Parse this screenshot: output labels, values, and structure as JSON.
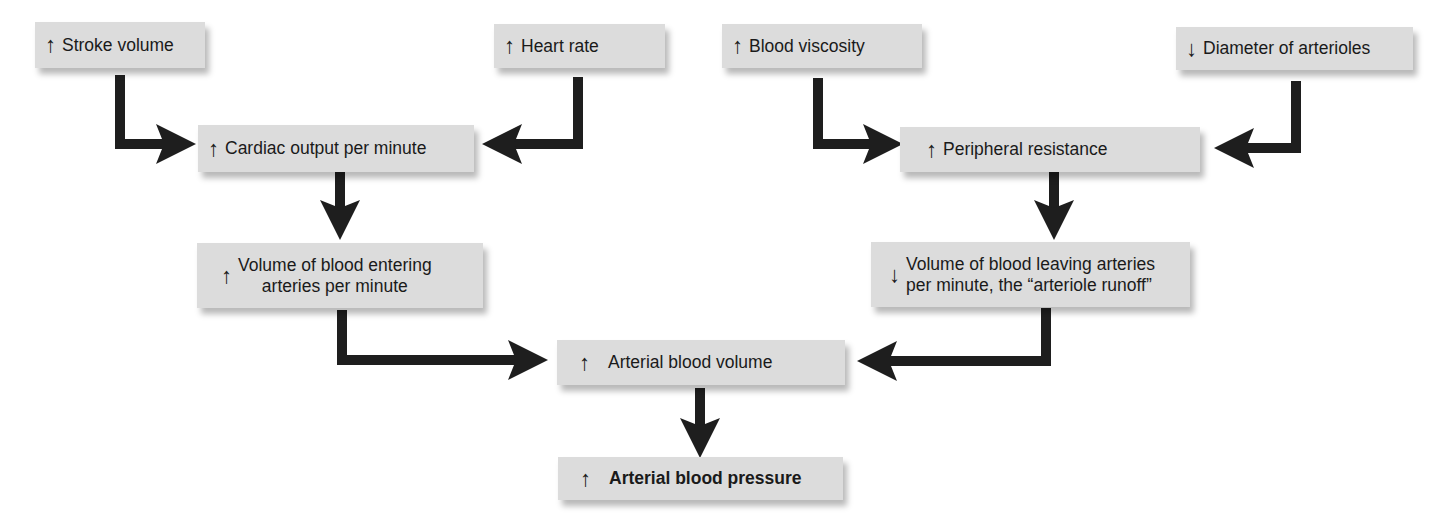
{
  "diagram": {
    "nodes": {
      "stroke_volume": {
        "indicator": "↑",
        "label": "Stroke volume"
      },
      "heart_rate": {
        "indicator": "↑",
        "label": "Heart rate"
      },
      "blood_viscosity": {
        "indicator": "↑",
        "label": "Blood viscosity"
      },
      "diameter_arterioles": {
        "indicator": "↓",
        "label": "Diameter of arterioles"
      },
      "cardiac_output": {
        "indicator": "↑",
        "label": "Cardiac output per minute"
      },
      "peripheral_resistance": {
        "indicator": "↑",
        "label": "Peripheral resistance"
      },
      "volume_entering": {
        "indicator": "↑",
        "line1": "Volume of blood entering",
        "line2": "arteries per minute"
      },
      "volume_leaving": {
        "indicator": "↓",
        "line1": "Volume of blood leaving arteries",
        "line2": "per minute, the “arteriole runoff”"
      },
      "arterial_blood_volume": {
        "indicator": "↑",
        "label": "Arterial blood volume"
      },
      "arterial_blood_pressure": {
        "indicator": "↑",
        "label": "Arterial blood pressure"
      }
    },
    "edges": [
      [
        "stroke_volume",
        "cardiac_output"
      ],
      [
        "heart_rate",
        "cardiac_output"
      ],
      [
        "blood_viscosity",
        "peripheral_resistance"
      ],
      [
        "diameter_arterioles",
        "peripheral_resistance"
      ],
      [
        "cardiac_output",
        "volume_entering"
      ],
      [
        "peripheral_resistance",
        "volume_leaving"
      ],
      [
        "volume_entering",
        "arterial_blood_volume"
      ],
      [
        "volume_leaving",
        "arterial_blood_volume"
      ],
      [
        "arterial_blood_volume",
        "arterial_blood_pressure"
      ]
    ],
    "colors": {
      "box": "#dcdcdc",
      "arrow": "#1e1e1e",
      "text": "#1a1a1a"
    }
  }
}
